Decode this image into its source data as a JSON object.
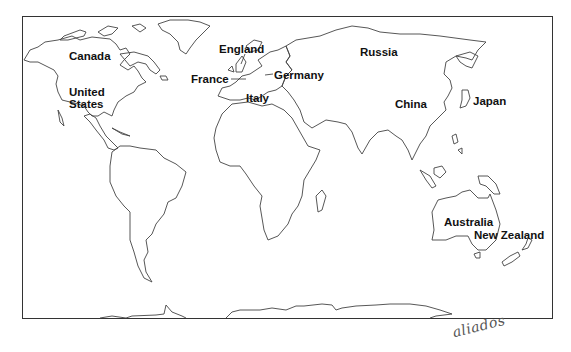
{
  "map": {
    "type": "world-outline-map",
    "labels": [
      {
        "id": "canada",
        "text": "Canada",
        "x": 69,
        "y": 50
      },
      {
        "id": "united-states",
        "text": "United\nStates",
        "x": 69,
        "y": 86
      },
      {
        "id": "england",
        "text": "England",
        "x": 219,
        "y": 43
      },
      {
        "id": "france",
        "text": "France",
        "x": 191,
        "y": 73
      },
      {
        "id": "germany",
        "text": "Germany",
        "x": 274,
        "y": 69
      },
      {
        "id": "italy",
        "text": "Italy",
        "x": 246,
        "y": 92
      },
      {
        "id": "russia",
        "text": "Russia",
        "x": 360,
        "y": 46
      },
      {
        "id": "china",
        "text": "China",
        "x": 395,
        "y": 98
      },
      {
        "id": "japan",
        "text": "Japan",
        "x": 473,
        "y": 95
      },
      {
        "id": "australia",
        "text": "Australia",
        "x": 444,
        "y": 216
      },
      {
        "id": "new-zealand",
        "text": "New Zealand",
        "x": 474,
        "y": 229
      }
    ],
    "signature": "aliados"
  }
}
